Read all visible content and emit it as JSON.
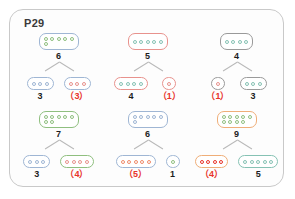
{
  "page": {
    "title": "P29"
  },
  "colors": {
    "answer_red": "#e8332a",
    "value_black": "#1d1d1d",
    "card_border": "#c9c9c9",
    "connector": "#b9b9b9",
    "green": "#8fbf7f",
    "red": "#e8928d",
    "blue": "#9fb6d4",
    "orange": "#efae78",
    "teal": "#86c2b4",
    "gray": "#9a9a9a"
  },
  "trees": [
    {
      "id": "tree-1",
      "total": {
        "value": "6",
        "is_answer": false,
        "box_color": "#9fb6d4",
        "dot_color": "#8fbf7f",
        "rows": [
          5,
          1
        ]
      },
      "left": {
        "value": "3",
        "is_answer": false,
        "box_color": "#9fb6d4",
        "dot_color": "#9fb6d4",
        "rows": [
          3
        ]
      },
      "right": {
        "value": "（3）",
        "is_answer": true,
        "box_color": "#9fb6d4",
        "dot_color": "#e8928d",
        "rows": [
          3
        ]
      }
    },
    {
      "id": "tree-2",
      "total": {
        "value": "5",
        "is_answer": false,
        "box_color": "#e8928d",
        "dot_color": "#86c2b4",
        "rows": [
          5
        ]
      },
      "left": {
        "value": "4",
        "is_answer": false,
        "box_color": "#e8928d",
        "dot_color": "#86c2b4",
        "rows": [
          4
        ]
      },
      "right": {
        "value": "（1）",
        "is_answer": true,
        "box_color": "#e8928d",
        "dot_color": "#e8928d",
        "rows": [
          1
        ]
      }
    },
    {
      "id": "tree-3",
      "total": {
        "value": "4",
        "is_answer": false,
        "box_color": "#9a9a9a",
        "dot_color": "#86c2b4",
        "rows": [
          4
        ]
      },
      "left": {
        "value": "（1）",
        "is_answer": true,
        "box_color": "#9a9a9a",
        "dot_color": "#e8928d",
        "rows": [
          1
        ]
      },
      "right": {
        "value": "3",
        "is_answer": false,
        "box_color": "#9a9a9a",
        "dot_color": "#86c2b4",
        "rows": [
          3
        ]
      }
    },
    {
      "id": "tree-4",
      "total": {
        "value": "7",
        "is_answer": false,
        "box_color": "#8fbf7f",
        "dot_color": "#8fbf7f",
        "rows": [
          5,
          2
        ]
      },
      "left": {
        "value": "3",
        "is_answer": false,
        "box_color": "#9fb6d4",
        "dot_color": "#9fb6d4",
        "rows": [
          3
        ]
      },
      "right": {
        "value": "（4）",
        "is_answer": true,
        "box_color": "#8fbf7f",
        "dot_color": "#e8928d",
        "rows": [
          4
        ]
      }
    },
    {
      "id": "tree-5",
      "total": {
        "value": "6",
        "is_answer": false,
        "box_color": "#9fb6d4",
        "dot_color": "#9fb6d4",
        "rows": [
          5,
          1
        ]
      },
      "left": {
        "value": "（5）",
        "is_answer": true,
        "box_color": "#9fb6d4",
        "dot_color": "#ef8a6a",
        "rows": [
          5
        ]
      },
      "right": {
        "value": "1",
        "is_answer": false,
        "box_color": "#9fb6d4",
        "dot_color": "#8fbf7f",
        "rows": [
          1
        ]
      }
    },
    {
      "id": "tree-6",
      "total": {
        "value": "9",
        "is_answer": false,
        "box_color": "#efae78",
        "dot_color": "#8fbf7f",
        "rows": [
          5,
          4
        ]
      },
      "left": {
        "value": "（4）",
        "is_answer": true,
        "box_color": "#efae78",
        "dot_color": "#e8332a",
        "rows": [
          4
        ]
      },
      "right": {
        "value": "5",
        "is_answer": false,
        "box_color": "#86c2b4",
        "dot_color": "#86c2b4",
        "rows": [
          5
        ]
      }
    }
  ]
}
